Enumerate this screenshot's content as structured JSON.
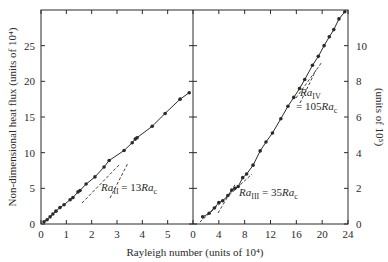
{
  "chart_data": {
    "type": "line",
    "xlabel": "Rayleigh number (units of 10⁴)",
    "ylabel_left": "Non-dimensional heat flux (units of 10⁴)",
    "ylabel_right": "(units of 10⁵)",
    "grid": false,
    "panels": [
      {
        "name": "left",
        "x_ticks": [
          "0",
          "1",
          "2",
          "3",
          "4",
          "5"
        ],
        "x_range": [
          0,
          6
        ],
        "y_ticks": [
          "0",
          "5",
          "10",
          "15",
          "20",
          "25"
        ],
        "y_range": [
          0,
          30
        ],
        "annotation": {
          "text_main": "Ra",
          "sub": "II",
          "rest": " = 13",
          "text_c": "Ra",
          "sub_c": "c",
          "ra_value": 2.4
        },
        "series": [
          {
            "name": "measured",
            "x": [
              0.12,
              0.24,
              0.36,
              0.47,
              0.59,
              0.75,
              0.91,
              1.15,
              1.26,
              1.46,
              1.54,
              1.78,
              2.13,
              2.49,
              2.69,
              3.28,
              3.6,
              3.72,
              3.79,
              4.39,
              4.9,
              5.49,
              5.85
            ],
            "y": [
              0.3,
              0.6,
              1.0,
              1.4,
              1.8,
              2.3,
              2.7,
              3.4,
              3.7,
              4.5,
              4.7,
              5.6,
              6.6,
              8.0,
              8.9,
              10.3,
              11.4,
              11.9,
              12.1,
              13.7,
              15.5,
              17.5,
              18.4
            ]
          }
        ]
      },
      {
        "name": "right",
        "x_ticks": [
          "0",
          "4",
          "8",
          "12",
          "16",
          "20",
          "24"
        ],
        "x_range": [
          0,
          24
        ],
        "y_ticks": [
          "0",
          "2",
          "4",
          "6",
          "8",
          "10"
        ],
        "y_range": [
          0,
          12
        ],
        "annotations": [
          {
            "text_main": "Ra",
            "sub": "III",
            "rest": " = 35",
            "text_c": "Ra",
            "sub_c": "c",
            "ra_value": 6.5
          },
          {
            "text_main": "Ra",
            "sub": "IV",
            "rest": "= 105",
            "text_c": "Ra",
            "sub_c": "c",
            "ra_value": 19.5
          }
        ],
        "series": [
          {
            "name": "measured",
            "x": [
              1.5,
              2.5,
              3.3,
              4.0,
              4.6,
              5.4,
              6.0,
              6.5,
              7.0,
              7.7,
              8.3,
              9.3,
              10.4,
              11.3,
              12.3,
              13.6,
              14.7,
              15.6,
              16.5,
              17.3,
              18.5,
              19.4,
              20.3,
              21.1,
              21.8,
              22.6,
              23.5
            ],
            "y": [
              0.4,
              0.6,
              0.9,
              1.2,
              1.3,
              1.6,
              1.9,
              2.0,
              2.1,
              2.6,
              2.8,
              3.3,
              4.1,
              4.6,
              5.1,
              5.9,
              6.6,
              7.1,
              7.6,
              8.1,
              8.9,
              9.4,
              10.0,
              10.5,
              10.9,
              11.5,
              11.9
            ]
          }
        ]
      }
    ]
  }
}
